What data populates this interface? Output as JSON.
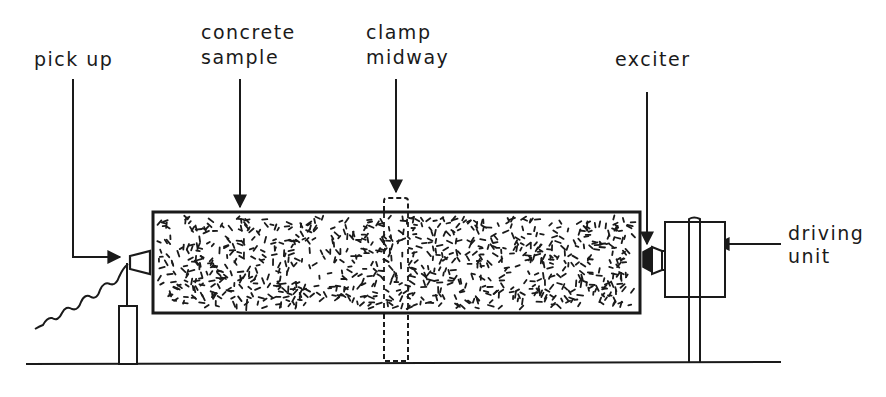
{
  "diagram": {
    "labels": {
      "pick_up": "pick up",
      "concrete_line1": "concrete",
      "concrete_line2": "sample",
      "clamp_line1": "clamp",
      "clamp_line2": "midway",
      "exciter": "exciter",
      "driving_line1": "driving",
      "driving_line2": "unit"
    },
    "components": [
      "pick-up transducer",
      "concrete sample (cylinder)",
      "midway clamp (dashed)",
      "exciter",
      "driving unit",
      "ground line",
      "supports"
    ],
    "colors": {
      "ink": "#1a1a1a",
      "background": "#ffffff"
    }
  }
}
